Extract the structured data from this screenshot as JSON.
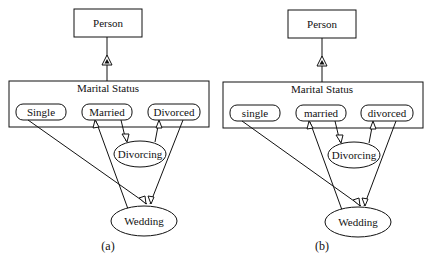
{
  "figure": {
    "panels": [
      {
        "caption": "(a)",
        "superclass": "Person",
        "container": "Marital Status",
        "states": [
          "Single",
          "Married",
          "Divorced"
        ],
        "transitions": [
          "Divorcing",
          "Wedding"
        ]
      },
      {
        "caption": "(b)",
        "superclass": "Person",
        "container": "Marital Status",
        "states": [
          "single",
          "married",
          "divorced"
        ],
        "transitions": [
          "Divorcing",
          "Wedding"
        ]
      }
    ]
  },
  "colors": {
    "stroke": "#111111",
    "background": "#ffffff"
  }
}
